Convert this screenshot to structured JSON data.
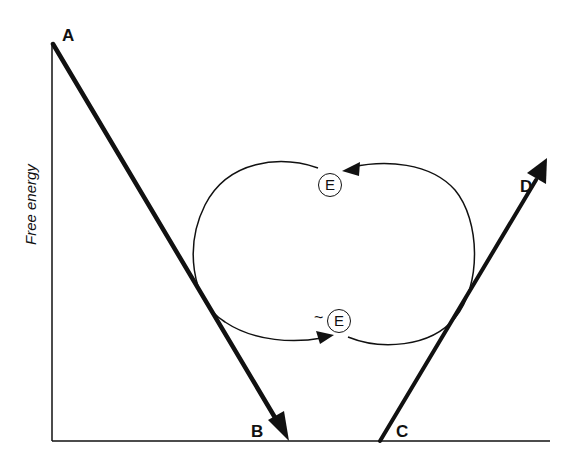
{
  "diagram": {
    "axis": {
      "y_label": "Free energy"
    },
    "points": {
      "A": "A",
      "B": "B",
      "C": "C",
      "D": "D"
    },
    "enzyme": {
      "ground_state": "E",
      "activated_state": "E",
      "activated_prefix": "~"
    },
    "edges": [
      {
        "from": "A",
        "to": "B",
        "style": "thick-arrow",
        "direction": "downhill"
      },
      {
        "from": "C",
        "to": "D",
        "style": "thick-arrow",
        "direction": "uphill"
      },
      {
        "from": "E",
        "to": "~E",
        "style": "thin-curved-arrow",
        "side": "left"
      },
      {
        "from": "~E",
        "to": "E",
        "style": "thin-curved-arrow",
        "side": "right"
      }
    ],
    "colors": {
      "ink": "#111111",
      "background": "#ffffff"
    }
  }
}
